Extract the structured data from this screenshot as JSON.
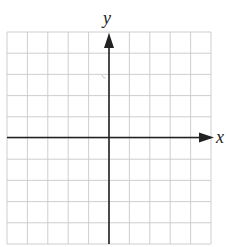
{
  "chart_data": {
    "type": "scatter",
    "title": "",
    "xlabel": "x",
    "ylabel": "y",
    "grid": true,
    "xlim": [
      -5,
      5
    ],
    "ylim": [
      -5,
      5
    ],
    "grid_columns": 10,
    "grid_rows": 10,
    "x_ticks_labeled": [],
    "y_ticks_labeled": [],
    "series": [],
    "points": [],
    "legend": null
  },
  "colors": {
    "grid": "#c8c8c8",
    "axis": "#222222",
    "background": "#ffffff"
  },
  "labels": {
    "x_axis": "x",
    "y_axis": "y"
  }
}
